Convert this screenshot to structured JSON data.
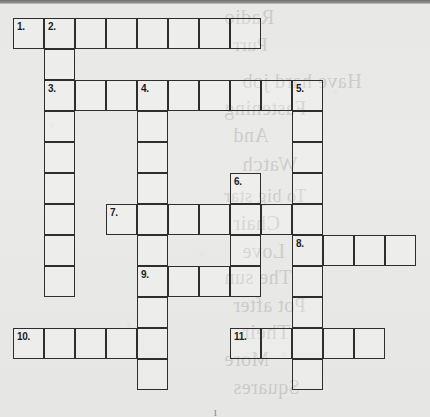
{
  "puzzle": {
    "kind": "crossword-grid",
    "title": "Crossword Puzzle Grid",
    "columns": 13,
    "rows": 12,
    "cell_size": 31,
    "origin_x": 13,
    "origin_y": 18,
    "ink_color": "#2e2e2e",
    "paper_color": "#e9e9e7",
    "footer_mark": "1"
  },
  "entries": [
    {
      "number": "1.",
      "direction": "across",
      "row": 1,
      "col": 1,
      "length": 8
    },
    {
      "number": "2.",
      "direction": "down",
      "row": 1,
      "col": 2,
      "length": 9
    },
    {
      "number": "3.",
      "direction": "across",
      "row": 3,
      "col": 2,
      "length": 9
    },
    {
      "number": "4.",
      "direction": "down",
      "row": 3,
      "col": 5,
      "length": 10
    },
    {
      "number": "5.",
      "direction": "down",
      "row": 3,
      "col": 10,
      "length": 10
    },
    {
      "number": "6.",
      "direction": "down",
      "row": 6,
      "col": 8,
      "length": 4
    },
    {
      "number": "7.",
      "direction": "across",
      "row": 7,
      "col": 4,
      "length": 7
    },
    {
      "number": "8.",
      "direction": "across",
      "row": 8,
      "col": 10,
      "length": 4
    },
    {
      "number": "9.",
      "direction": "across",
      "row": 9,
      "col": 5,
      "length": 4
    },
    {
      "number": "10.",
      "direction": "across",
      "row": 11,
      "col": 1,
      "length": 5
    },
    {
      "number": "11.",
      "direction": "across",
      "row": 11,
      "col": 8,
      "length": 5
    }
  ],
  "numbered_cells": [
    {
      "label": "1.",
      "row": 1,
      "col": 1
    },
    {
      "label": "2.",
      "row": 1,
      "col": 2
    },
    {
      "label": "3.",
      "row": 3,
      "col": 2
    },
    {
      "label": "4.",
      "row": 3,
      "col": 5
    },
    {
      "label": "5.",
      "row": 3,
      "col": 10
    },
    {
      "label": "6.",
      "row": 6,
      "col": 8
    },
    {
      "label": "7.",
      "row": 7,
      "col": 4
    },
    {
      "label": "8.",
      "row": 8,
      "col": 10
    },
    {
      "label": "9.",
      "row": 9,
      "col": 5
    },
    {
      "label": "10.",
      "row": 11,
      "col": 1
    },
    {
      "label": "11.",
      "row": 11,
      "col": 8
    }
  ],
  "bleed_through_text": [
    {
      "text": "Radio",
      "top": 6,
      "size": 20
    },
    {
      "text": "Purr",
      "top": 34,
      "size": 19
    },
    {
      "text": "Have hard job",
      "top": 70,
      "size": 20
    },
    {
      "text": "Fastening",
      "top": 97,
      "size": 20
    },
    {
      "text": "And",
      "top": 124,
      "size": 20
    },
    {
      "text": "Watch",
      "top": 152,
      "size": 21
    },
    {
      "text": "To big star",
      "top": 186,
      "size": 18
    },
    {
      "text": "Chair",
      "top": 212,
      "size": 20
    },
    {
      "text": "Love",
      "top": 240,
      "size": 20
    },
    {
      "text": "The sun",
      "top": 266,
      "size": 20
    },
    {
      "text": "Pot after",
      "top": 294,
      "size": 20
    },
    {
      "text": "Their",
      "top": 320,
      "size": 21
    },
    {
      "text": "More",
      "top": 348,
      "size": 20
    },
    {
      "text": "Squares",
      "top": 376,
      "size": 20
    }
  ]
}
